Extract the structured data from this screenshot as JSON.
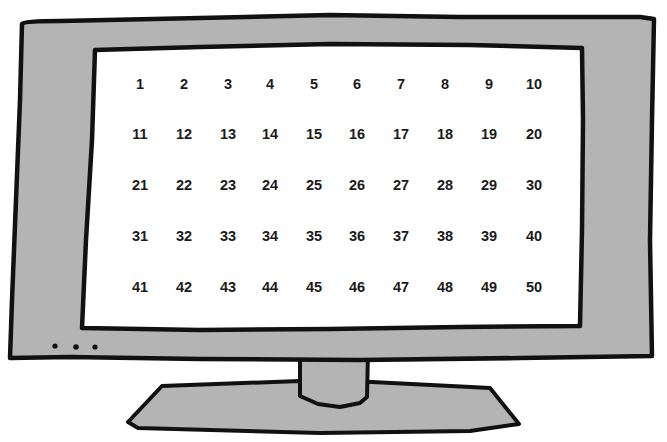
{
  "illustration": {
    "subject": "computer monitor with number grid on screen",
    "colors": {
      "bezel": "#b4b4b4",
      "outline": "#111111",
      "screen": "#ffffff",
      "text": "#1a1a1a"
    },
    "indicator_dot_count": 3
  },
  "screen": {
    "rows": [
      [
        "1",
        "2",
        "3",
        "4",
        "5",
        "6",
        "7",
        "8",
        "9",
        "10"
      ],
      [
        "11",
        "12",
        "13",
        "14",
        "15",
        "16",
        "17",
        "18",
        "19",
        "20"
      ],
      [
        "21",
        "22",
        "23",
        "24",
        "25",
        "26",
        "27",
        "28",
        "29",
        "30"
      ],
      [
        "31",
        "32",
        "33",
        "34",
        "35",
        "36",
        "37",
        "38",
        "39",
        "40"
      ],
      [
        "41",
        "42",
        "43",
        "44",
        "45",
        "46",
        "47",
        "48",
        "49",
        "50"
      ]
    ]
  }
}
